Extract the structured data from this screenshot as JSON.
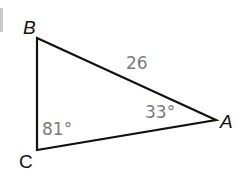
{
  "figure": {
    "type": "triangle",
    "vertices": {
      "B": {
        "label": "B",
        "x": 37,
        "y": 38
      },
      "C": {
        "label": "C",
        "x": 37,
        "y": 150
      },
      "A": {
        "label": "A",
        "x": 216,
        "y": 120
      }
    },
    "side_BA": {
      "label": "26"
    },
    "angle_C": {
      "label": "81°"
    },
    "angle_A": {
      "label": "33°"
    },
    "stroke_color": "#111111",
    "measure_color": "#7a7a7a"
  }
}
